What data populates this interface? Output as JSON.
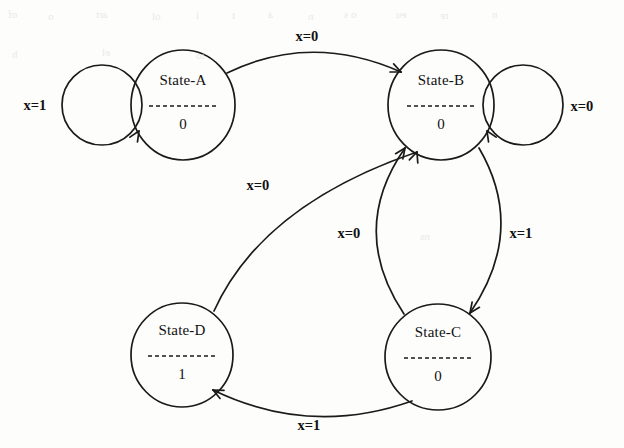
{
  "diagram": {
    "type": "state-transition-diagram",
    "canvas": {
      "width": 624,
      "height": 448,
      "background": "#fdfdfc"
    },
    "stroke_color": "#1a1a1a",
    "text_color": "#111111"
  },
  "states": [
    {
      "id": "A",
      "name": "State-A",
      "output": "0",
      "cx": 183,
      "cy": 105,
      "rx": 52,
      "ry": 55,
      "name_dy": -20,
      "output_dy": 24
    },
    {
      "id": "B",
      "name": "State-B",
      "output": "0",
      "cx": 441,
      "cy": 105,
      "rx": 53,
      "ry": 55,
      "name_dy": -20,
      "output_dy": 24
    },
    {
      "id": "C",
      "name": "State-C",
      "output": "0",
      "cx": 438,
      "cy": 357,
      "rx": 53,
      "ry": 53,
      "name_dy": -20,
      "output_dy": 24
    },
    {
      "id": "D",
      "name": "State-D",
      "output": "1",
      "cx": 182,
      "cy": 355,
      "rx": 51,
      "ry": 52,
      "name_dy": -20,
      "output_dy": 24
    }
  ],
  "transitions": [
    {
      "id": "a-self",
      "from": "A",
      "to": "A",
      "label": "x=1",
      "kind": "self-loop",
      "label_x": 35,
      "label_y": 110,
      "loop_cx": 102,
      "loop_cy": 105,
      "loop_r": 40,
      "arrow": {
        "x": 139,
        "y": 131,
        "rot": -58
      }
    },
    {
      "id": "a-to-b",
      "from": "A",
      "to": "B",
      "label": "x=0",
      "kind": "arc",
      "label_x": 307,
      "label_y": 41,
      "path": "M 227,73 Q 311,32 401,72",
      "arrow": {
        "x": 401,
        "y": 72,
        "rot": 24
      }
    },
    {
      "id": "b-self",
      "from": "B",
      "to": "B",
      "label": "x=0",
      "kind": "self-loop",
      "label_x": 582,
      "label_y": 111,
      "loop_cx": 523,
      "loop_cy": 105,
      "loop_r": 40,
      "arrow": {
        "x": 487,
        "y": 131,
        "rot": 238
      }
    },
    {
      "id": "b-to-c",
      "from": "B",
      "to": "C",
      "label": "x=1",
      "kind": "arc",
      "label_x": 521,
      "label_y": 238,
      "path": "M 479,148 Q 527,230 470,313",
      "arrow": {
        "x": 470,
        "y": 313,
        "rot": 125
      }
    },
    {
      "id": "c-to-b",
      "from": "C",
      "to": "B",
      "label": "x=0",
      "kind": "arc",
      "label_x": 349,
      "label_y": 238,
      "path": "M 404,314 Q 348,230 405,148",
      "arrow": {
        "x": 405,
        "y": 148,
        "rot": -55
      }
    },
    {
      "id": "c-to-d",
      "from": "C",
      "to": "D",
      "label": "x=1",
      "kind": "arc",
      "label_x": 309,
      "label_y": 430,
      "path": "M 412,401 Q 310,437 213,390",
      "arrow": {
        "x": 213,
        "y": 390,
        "rot": 206
      }
    },
    {
      "id": "d-to-b",
      "from": "D",
      "to": "B",
      "label": "x=0",
      "kind": "arc",
      "label_x": 258,
      "label_y": 190,
      "path": "M 214,311 Q 262,205 417,152",
      "arrow": {
        "x": 417,
        "y": 152,
        "rot": -70
      }
    }
  ],
  "graph_data": {
    "description": "Mealy/Moore-style state diagram with four states and input x",
    "input_variable": "x",
    "edges": [
      {
        "from": "State-A",
        "to": "State-A",
        "input": "x=1"
      },
      {
        "from": "State-A",
        "to": "State-B",
        "input": "x=0"
      },
      {
        "from": "State-B",
        "to": "State-B",
        "input": "x=0"
      },
      {
        "from": "State-B",
        "to": "State-C",
        "input": "x=1"
      },
      {
        "from": "State-C",
        "to": "State-B",
        "input": "x=0"
      },
      {
        "from": "State-C",
        "to": "State-D",
        "input": "x=1"
      },
      {
        "from": "State-D",
        "to": "State-B",
        "input": "x=0"
      }
    ],
    "state_outputs": {
      "State-A": "0",
      "State-B": "0",
      "State-C": "0",
      "State-D": "1"
    }
  },
  "scan_artifacts": [
    {
      "text": "of",
      "x": 8,
      "y": 8
    },
    {
      "text": "o",
      "x": 48,
      "y": 10
    },
    {
      "text": "art",
      "x": 96,
      "y": 8
    },
    {
      "text": "ol",
      "x": 152,
      "y": 10
    },
    {
      "text": "i",
      "x": 196,
      "y": 9
    },
    {
      "text": "t",
      "x": 232,
      "y": 9
    },
    {
      "text": "a",
      "x": 268,
      "y": 8
    },
    {
      "text": "n",
      "x": 308,
      "y": 10
    },
    {
      "text": "o s",
      "x": 344,
      "y": 8
    },
    {
      "text": "eu",
      "x": 396,
      "y": 8
    },
    {
      "text": "re",
      "x": 440,
      "y": 9
    },
    {
      "text": "n",
      "x": 492,
      "y": 8
    },
    {
      "text": "h",
      "x": 12,
      "y": 48
    },
    {
      "text": "el",
      "x": 102,
      "y": 46
    },
    {
      "text": "to",
      "x": 196,
      "y": 49
    },
    {
      "text": "ns",
      "x": 420,
      "y": 230
    }
  ]
}
